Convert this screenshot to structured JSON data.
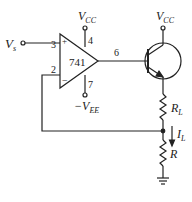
{
  "diagram": {
    "type": "circuit",
    "input": {
      "label_main": "V",
      "label_sub": "s"
    },
    "opamp": {
      "label": "741",
      "pin_noninverting": "3",
      "pin_inverting": "2",
      "pin_vcc": "4",
      "pin_vee": "7",
      "pin_output": "6",
      "plus_sign": "+",
      "minus_sign": "−"
    },
    "supplies": {
      "vcc_opamp": {
        "main": "V",
        "sub": "CC"
      },
      "vee_opamp": {
        "prefix": "−",
        "main": "V",
        "sub": "EE"
      },
      "vcc_transistor": {
        "main": "V",
        "sub": "CC"
      }
    },
    "components": {
      "load_resistor": {
        "main": "R",
        "sub": "L"
      },
      "sense_resistor": {
        "main": "R"
      },
      "load_current": {
        "main": "I",
        "sub": "L"
      }
    },
    "colors": {
      "stroke": "#222222",
      "background": "#ffffff"
    }
  }
}
